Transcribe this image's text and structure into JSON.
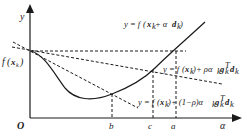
{
  "diagram": {
    "type": "line-search-armijo-goldstein",
    "axes": {
      "x_label": "α",
      "y_label": "y",
      "origin_label": "O",
      "y_intercept_label": "f(x_k)"
    },
    "curves": {
      "objective": "y = f(x_k + α d_k)",
      "upper_line": "y = f(x_k) + ρ α_k g_k^T d_k",
      "lower_line": "y = f(x_k) + (1−ρ) α_k g_k^T d_k"
    },
    "x_ticks": [
      "b",
      "c",
      "a"
    ],
    "colors": {
      "line": "#1a1a1a",
      "background": "#ffffff"
    }
  },
  "labels": {
    "y": "y",
    "origin": "O",
    "alpha": "α",
    "fxk_f": "f",
    "fxk_x": "x",
    "fxk_k": "k",
    "tick_b": "b",
    "tick_c": "c",
    "tick_a": "a",
    "eq1_prefix": "y = f",
    "eq1_arg_x": "x",
    "eq1_arg_k": "k",
    "eq1_plus": " + α ",
    "eq1_d": "d",
    "eq1_dk": "k",
    "eq2_prefix": "y = f",
    "eq2_x": "x",
    "eq2_k": "k",
    "eq2_mid": " + ρα",
    "eq2_ak": "k",
    "eq2_g": "g",
    "eq2_gk": "k",
    "eq2_T": "T",
    "eq2_d": "d",
    "eq2_dk": "k",
    "eq3_prefix": "y = f",
    "eq3_x": "x",
    "eq3_k": "k",
    "eq3_mid": " + (1−ρ)α",
    "eq3_ak": "k",
    "eq3_g": "g",
    "eq3_gk": "k",
    "eq3_T": "T",
    "eq3_d": "d",
    "eq3_dk": "k"
  }
}
